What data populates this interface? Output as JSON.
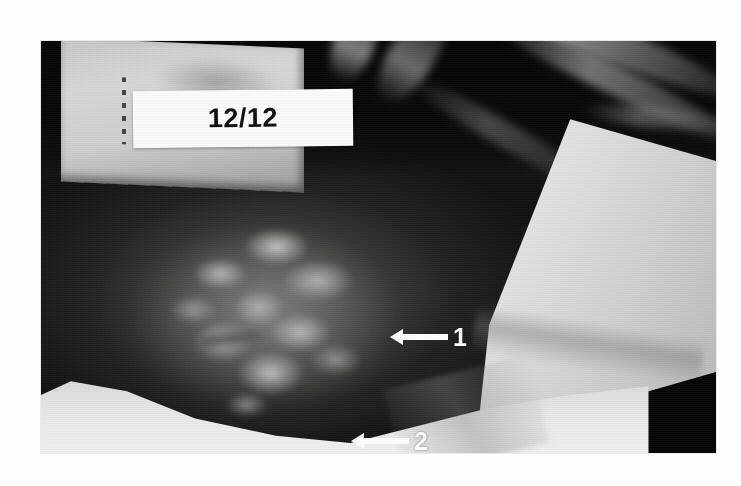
{
  "figure": {
    "kind": "clinical-photograph",
    "page_background": "#ffffff"
  },
  "photo": {
    "frame": {
      "left": 41,
      "top": 41,
      "width": 675,
      "height": 412
    },
    "palette": {
      "darkest": "#050505",
      "skin_dark": "#1c1c1c",
      "skin_mid": "#3a3a3a",
      "lesion_highlight": "#d7d7d2",
      "drape_white": "#efefef",
      "placard_grey": "#cfcfcf",
      "label_white": "#fdfdfd",
      "annotation_white": "#ffffff",
      "label_text": "#0d0d0d"
    },
    "regions": [
      {
        "name": "placard",
        "label": "grey instrument placard, upper left"
      },
      {
        "name": "date-label",
        "label": "white adhesive label"
      },
      {
        "name": "lesion",
        "label": "mottled skin lesion, centre left"
      },
      {
        "name": "drape-right",
        "label": "white surgical drape, right"
      },
      {
        "name": "drape-bottom",
        "label": "white surgical drape, bottom"
      },
      {
        "name": "top-dark",
        "label": "dark operating-theatre background, top"
      }
    ]
  },
  "date_label": {
    "text": "12/12"
  },
  "annotations": [
    {
      "id": "1",
      "number": "1",
      "direction": "left",
      "target": "upper lesion margin"
    },
    {
      "id": "2",
      "number": "2",
      "direction": "left",
      "target": "lower lesion margin"
    }
  ]
}
